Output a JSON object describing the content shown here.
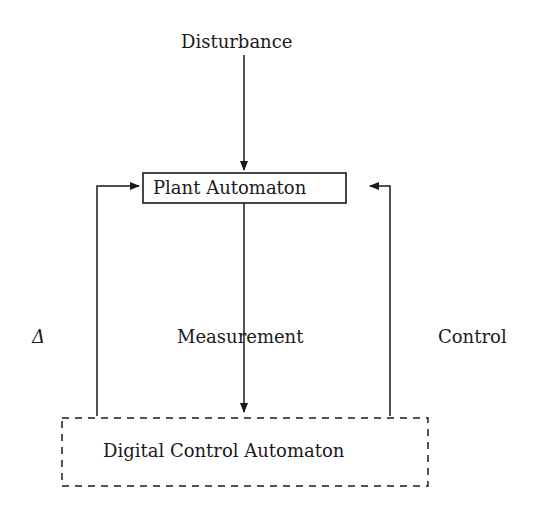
{
  "diagram": {
    "nodes": {
      "disturbance": "Disturbance",
      "plant": "Plant Automaton",
      "controller": "Digital Control Automaton"
    },
    "edge_labels": {
      "delta": "Δ",
      "measurement": "Measurement",
      "control": "Control"
    },
    "edges": [
      {
        "from": "Disturbance",
        "to": "Plant Automaton"
      },
      {
        "from": "Plant Automaton",
        "to": "Digital Control Automaton",
        "label": "Measurement"
      },
      {
        "from": "Digital Control Automaton",
        "to": "Plant Automaton",
        "label": "Δ",
        "side": "left"
      },
      {
        "from": "Digital Control Automaton",
        "to": "Plant Automaton",
        "label": "Control",
        "side": "right"
      }
    ]
  }
}
